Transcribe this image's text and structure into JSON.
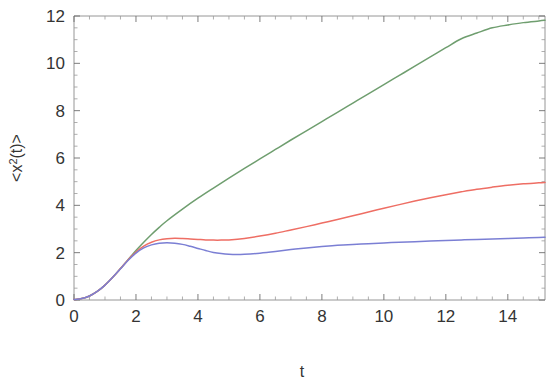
{
  "chart_data": {
    "type": "line",
    "title": "",
    "subtitle": "",
    "xlabel": "t",
    "ylabel": "<x²(t)>",
    "ylabel_parts": {
      "open": "<x",
      "exponent": "2",
      "arg": "(t)>"
    },
    "xlim": [
      0,
      15.2
    ],
    "ylim": [
      0,
      12
    ],
    "xticks": [
      0,
      2,
      4,
      6,
      8,
      10,
      12,
      14
    ],
    "xtick_labels": [
      "0",
      "2",
      "4",
      "6",
      "8",
      "10",
      "12",
      "14"
    ],
    "yticks": [
      0,
      2,
      4,
      6,
      8,
      10,
      12
    ],
    "ytick_labels": [
      "0",
      "2",
      "4",
      "6",
      "8",
      "10",
      "12"
    ],
    "xtick_minor_step": 0.5,
    "ytick_minor_step": 0.5,
    "grid": false,
    "legend": "none",
    "frame": "full-box",
    "background_color": "#ffffff",
    "series": [
      {
        "name": "green",
        "color": "#6f9e6f",
        "x": [
          0,
          0.25,
          0.5,
          0.75,
          1.0,
          1.25,
          1.5,
          1.75,
          2.0,
          2.25,
          2.5,
          2.75,
          3.0,
          3.5,
          4.0,
          4.5,
          5.0,
          5.5,
          6.0,
          6.5,
          7.0,
          7.5,
          8.0,
          8.5,
          9.0,
          9.5,
          10.0,
          10.5,
          11.0,
          11.5,
          12.0,
          12.5,
          13.0,
          13.5,
          14.0,
          14.5,
          15.0,
          15.2
        ],
        "y": [
          0.02,
          0.06,
          0.17,
          0.36,
          0.63,
          0.96,
          1.33,
          1.71,
          2.09,
          2.44,
          2.77,
          3.07,
          3.35,
          3.84,
          4.3,
          4.73,
          5.15,
          5.56,
          5.96,
          6.36,
          6.76,
          7.15,
          7.54,
          7.93,
          8.32,
          8.71,
          9.1,
          9.49,
          9.88,
          10.27,
          10.66,
          11.04,
          11.28,
          11.5,
          11.62,
          11.72,
          11.79,
          11.82
        ]
      },
      {
        "name": "red",
        "color": "#ee6e64",
        "x": [
          0,
          0.25,
          0.5,
          0.75,
          1.0,
          1.25,
          1.5,
          1.75,
          2.0,
          2.25,
          2.5,
          2.75,
          3.0,
          3.25,
          3.5,
          3.75,
          4.0,
          4.25,
          4.5,
          4.75,
          5.0,
          5.5,
          6.0,
          6.5,
          7.0,
          7.5,
          8.0,
          8.5,
          9.0,
          9.5,
          10.0,
          10.5,
          11.0,
          11.5,
          12.0,
          12.5,
          13.0,
          13.5,
          14.0,
          14.5,
          15.0,
          15.2
        ],
        "y": [
          0.02,
          0.06,
          0.17,
          0.36,
          0.63,
          0.96,
          1.33,
          1.7,
          2.03,
          2.28,
          2.44,
          2.54,
          2.59,
          2.61,
          2.6,
          2.58,
          2.56,
          2.54,
          2.53,
          2.53,
          2.54,
          2.6,
          2.7,
          2.82,
          2.96,
          3.1,
          3.25,
          3.4,
          3.56,
          3.72,
          3.88,
          4.03,
          4.18,
          4.32,
          4.45,
          4.57,
          4.68,
          4.77,
          4.85,
          4.91,
          4.95,
          4.97
        ]
      },
      {
        "name": "blue",
        "color": "#7b7fd4",
        "x": [
          0,
          0.25,
          0.5,
          0.75,
          1.0,
          1.25,
          1.5,
          1.75,
          2.0,
          2.25,
          2.5,
          2.75,
          3.0,
          3.25,
          3.5,
          3.75,
          4.0,
          4.25,
          4.5,
          4.75,
          5.0,
          5.25,
          5.5,
          6.0,
          6.5,
          7.0,
          7.5,
          8.0,
          8.5,
          9.0,
          9.5,
          10.0,
          10.5,
          11.0,
          11.5,
          12.0,
          12.5,
          13.0,
          13.5,
          14.0,
          14.5,
          15.0,
          15.2
        ],
        "y": [
          0.02,
          0.06,
          0.17,
          0.36,
          0.63,
          0.96,
          1.32,
          1.68,
          1.98,
          2.2,
          2.33,
          2.4,
          2.42,
          2.4,
          2.35,
          2.27,
          2.18,
          2.09,
          2.01,
          1.96,
          1.93,
          1.92,
          1.93,
          1.98,
          2.05,
          2.13,
          2.2,
          2.26,
          2.31,
          2.35,
          2.38,
          2.41,
          2.44,
          2.46,
          2.49,
          2.51,
          2.54,
          2.56,
          2.58,
          2.6,
          2.62,
          2.64,
          2.65
        ]
      }
    ]
  },
  "axis_geometry": {
    "plot_left_px": 74,
    "plot_right_px": 545,
    "plot_top_px": 16,
    "plot_bottom_px": 300
  }
}
